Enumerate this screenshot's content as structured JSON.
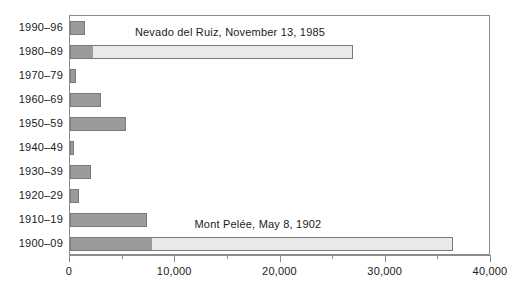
{
  "chart_data": {
    "type": "bar",
    "orientation": "horizontal",
    "title": "",
    "xlabel": "",
    "ylabel": "",
    "xlim": [
      0,
      40000
    ],
    "grid": false,
    "legend": "none",
    "categories": [
      "1990–96",
      "1980–89",
      "1970–79",
      "1960–69",
      "1950–59",
      "1940–49",
      "1930–39",
      "1920–29",
      "1910–19",
      "1900–09"
    ],
    "series": [
      {
        "name": "Deaths excluding single catastrophic eruption",
        "values": [
          1400,
          2200,
          600,
          2950,
          5300,
          400,
          2000,
          850,
          7300,
          7800
        ]
      },
      {
        "name": "Deaths from single catastrophic eruption",
        "values": [
          0,
          24700,
          0,
          0,
          0,
          0,
          0,
          0,
          0,
          28600
        ]
      }
    ],
    "totals": [
      1400,
      26900,
      600,
      2950,
      5300,
      400,
      2000,
      850,
      7300,
      36400
    ],
    "xticks_major": [
      0,
      10000,
      20000,
      30000,
      40000
    ],
    "xticks_major_labels": [
      "0",
      "10,000",
      "20,000",
      "30,000",
      "40,000"
    ],
    "xticks_minor": [
      5000,
      15000,
      25000,
      35000
    ],
    "annotations": [
      {
        "id": "nevado-del-ruiz",
        "text": "Nevado del Ruiz, November 13, 1985",
        "category": "1980–89",
        "x_value": 15300
      },
      {
        "id": "mont-pelee",
        "text": "Mont Pelée, May 8, 1902",
        "category": "1900–09",
        "x_value": 17950
      }
    ],
    "colors": {
      "bar_base_fill": "#9a9a9a",
      "bar_extension_fill": "#e9e9e9",
      "bar_border": "#7a7a7a",
      "axis": "#8c8c8c",
      "text": "#1a1a1a",
      "background": "#ffffff"
    }
  }
}
